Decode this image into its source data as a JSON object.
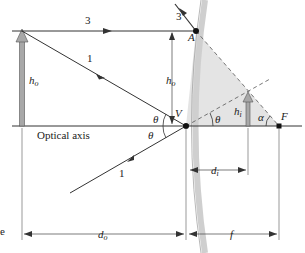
{
  "diagram": {
    "labels": {
      "optical_axis": "Optical axis",
      "object_height": "h",
      "object_height_sub": "o",
      "image_height": "h",
      "image_height_sub": "i",
      "object_distance": "d",
      "object_distance_sub": "o",
      "image_distance": "d",
      "image_distance_sub": "i",
      "focal_length": "f",
      "point_A": "A",
      "point_V": "V",
      "point_F": "F",
      "theta": "θ",
      "alpha": "α",
      "ray_1": "1",
      "ray_3": "3",
      "ray_1_reflected": "1",
      "ray_3_reflected": "3",
      "edge_fragment": "e"
    },
    "colors": {
      "line": "#333333",
      "shade": "#e4e4e4",
      "mirror": "#c8c8c8",
      "arrow_fill": "#a8a8a8",
      "point": "#111111"
    }
  }
}
